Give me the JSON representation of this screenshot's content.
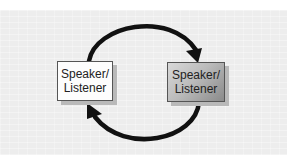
{
  "diagram": {
    "type": "cycle",
    "nodes": [
      {
        "id": "left",
        "line1": "Speaker/",
        "line2": "Listener",
        "fill": "#fdfdfd"
      },
      {
        "id": "right",
        "line1": "Speaker/",
        "line2": "Listener",
        "fill": "gradient-gray"
      }
    ],
    "edges": [
      {
        "from": "left",
        "to": "right",
        "path": "top-arc",
        "direction": "clockwise"
      },
      {
        "from": "right",
        "to": "left",
        "path": "bottom-arc",
        "direction": "clockwise"
      }
    ],
    "colors": {
      "background": "#ededed",
      "arrow": "#111111",
      "border": "#555555"
    }
  }
}
